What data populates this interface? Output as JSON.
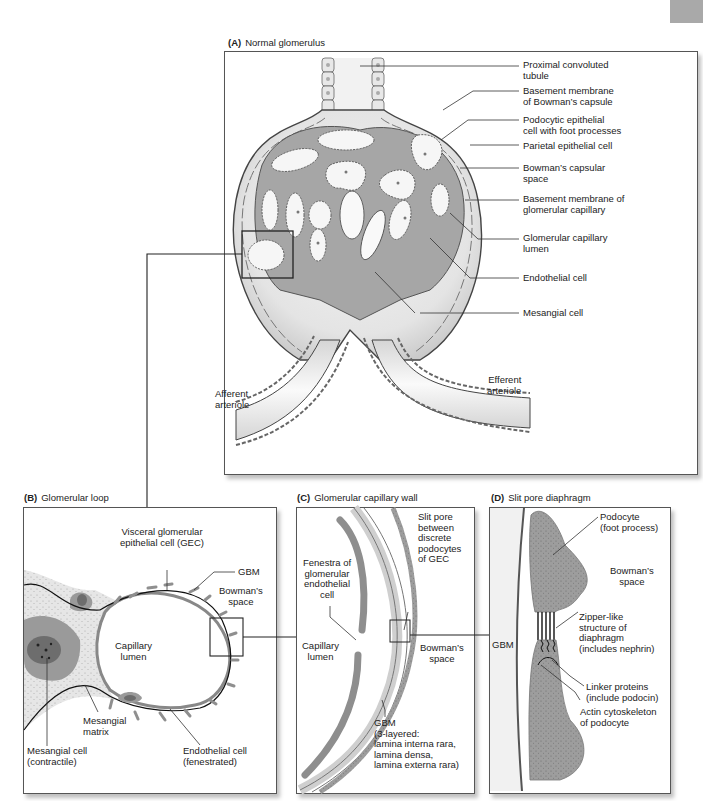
{
  "panels": {
    "A": {
      "letter": "(A)",
      "title": "Normal glomerulus",
      "labels": [
        {
          "id": "proximal-convoluted-tubule",
          "text": "Proximal convoluted\ntubule"
        },
        {
          "id": "basement-membrane-bowmans-capsule",
          "text": "Basement membrane\nof Bowman’s capsule"
        },
        {
          "id": "podocytic-epithelial-cell",
          "text": "Podocytic epithelial\ncell with foot processes"
        },
        {
          "id": "parietal-epithelial-cell",
          "text": "Parietal epithelial cell"
        },
        {
          "id": "bowmans-capsular-space",
          "text": "Bowman’s capsular\nspace"
        },
        {
          "id": "basement-membrane-glomerular-capillary",
          "text": "Basement membrane of\nglomerular capillary"
        },
        {
          "id": "glomerular-capillary-lumen",
          "text": "Glomerular capillary\nlumen"
        },
        {
          "id": "endothelial-cell",
          "text": "Endothelial cell"
        },
        {
          "id": "mesangial-cell",
          "text": "Mesangial cell"
        },
        {
          "id": "afferent-arteriole",
          "text": "Afferent\narteriole"
        },
        {
          "id": "efferent-arteriole",
          "text": "Efferent\narteriole"
        }
      ]
    },
    "B": {
      "letter": "(B)",
      "title": "Glomerular loop",
      "labels": [
        {
          "id": "visceral-gec",
          "text": "Visceral glomerular\nepithelial cell (GEC)"
        },
        {
          "id": "gbm",
          "text": "GBM"
        },
        {
          "id": "bowmans-space",
          "text": "Bowman’s\nspace"
        },
        {
          "id": "capillary-lumen",
          "text": "Capillary\nlumen"
        },
        {
          "id": "mesangial-matrix",
          "text": "Mesangial\nmatrix"
        },
        {
          "id": "mesangial-cell",
          "text": "Mesangial cell\n(contractile)"
        },
        {
          "id": "endothelial-cell",
          "text": "Endothelial cell\n(fenestrated)"
        }
      ]
    },
    "C": {
      "letter": "(C)",
      "title": "Glomerular capillary wall",
      "labels": [
        {
          "id": "slit-pore",
          "text": "Slit pore\nbetween\ndiscrete\npodocytes\nof GEC"
        },
        {
          "id": "fenestra",
          "text": "Fenestra of\nglomerular\nendothelial\ncell"
        },
        {
          "id": "capillary-lumen",
          "text": "Capillary\nlumen"
        },
        {
          "id": "bowmans-space",
          "text": "Bowman’s\nspace"
        },
        {
          "id": "gbm-3-layered",
          "text": "GBM\n(3-layered:\nlamina interna rara,\nlamina densa,\nlamina externa rara)"
        }
      ]
    },
    "D": {
      "letter": "(D)",
      "title": "Slit pore diaphragm",
      "labels": [
        {
          "id": "podocyte",
          "text": "Podocyte\n(foot process)"
        },
        {
          "id": "bowmans-space",
          "text": "Bowman’s\nspace"
        },
        {
          "id": "gbm",
          "text": "GBM"
        },
        {
          "id": "zipper-diaphragm",
          "text": "Zipper-like\nstructure of\ndiaphragm\n(includes nephrin)"
        },
        {
          "id": "linker-proteins",
          "text": "Linker proteins\n(include podocin)"
        },
        {
          "id": "actin-cytoskeleton",
          "text": "Actin cytoskeleton\nof podocyte"
        }
      ]
    }
  },
  "colors": {
    "cell_gray": "#9a9a9a",
    "dark_gray": "#6f6f6f",
    "light_gray": "#dcdcdc",
    "line": "#333333"
  }
}
